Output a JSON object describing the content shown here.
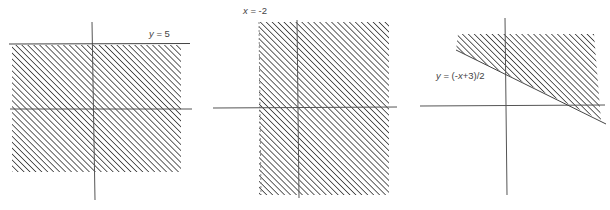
{
  "colors": {
    "axis": "#555555",
    "boundary": "#444444",
    "hatch": "#3a3a3a",
    "label": "#444444",
    "background": "#ffffff"
  },
  "panels": [
    {
      "id": "graph-y-leq-5",
      "boundary_label": "y = 5",
      "boundary_label_var": "y",
      "boundary_label_rest": " = 5",
      "boundary_type": "horizontal line",
      "shaded_region": "below line"
    },
    {
      "id": "graph-x-geq-neg2",
      "boundary_label": "x = -2",
      "boundary_label_var": "x",
      "boundary_label_rest": " = -2",
      "boundary_type": "vertical line (dashed edge)",
      "shaded_region": "right of line"
    },
    {
      "id": "graph-y-geq-line",
      "boundary_label": "y = (-x+3)/2",
      "boundary_label_var": "y",
      "boundary_label_rest": " = (-",
      "boundary_label_var2": "x",
      "boundary_label_rest2": "+3)/2",
      "boundary_type": "sloped line",
      "shaded_region": "above line"
    }
  ]
}
